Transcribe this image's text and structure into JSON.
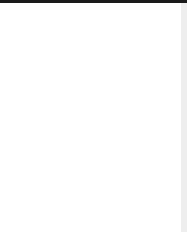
{
  "fret_label": "5 tr",
  "grid": {
    "strings_x": [
      13,
      42,
      70,
      99,
      127,
      155
    ],
    "frets_y": [
      30,
      71,
      109,
      147,
      185,
      221
    ]
  },
  "markers": [
    {
      "type": "dot",
      "string": 0,
      "row": 0
    },
    {
      "type": "dot",
      "string": 1,
      "row": 0
    },
    {
      "type": "dot",
      "string": 2,
      "row": 0
    },
    {
      "type": "square",
      "string": 3,
      "row": 0
    },
    {
      "type": "dot",
      "string": 4,
      "row": 0
    },
    {
      "type": "dot",
      "string": 5,
      "row": 0
    },
    {
      "type": "dot",
      "string": 1,
      "row": 2
    },
    {
      "type": "dot",
      "string": 2,
      "row": 2
    },
    {
      "type": "dot",
      "string": 3,
      "row": 2
    },
    {
      "type": "square",
      "string": 0,
      "row": 3
    },
    {
      "type": "dot",
      "string": 4,
      "row": 3
    },
    {
      "type": "square",
      "string": 5,
      "row": 3
    }
  ],
  "marker_row_y": [
    50,
    90,
    128,
    165,
    203
  ]
}
